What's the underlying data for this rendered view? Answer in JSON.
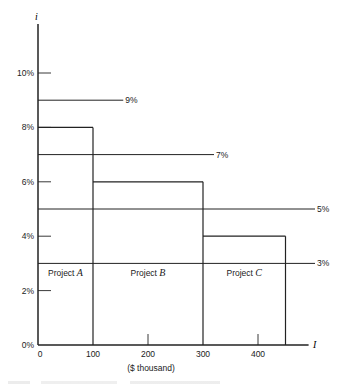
{
  "chart_data": {
    "type": "bar",
    "title": "",
    "xlabel": "($ thousand)",
    "x_axis_symbol": "I",
    "y_axis_symbol": "i",
    "xlim": [
      0,
      500
    ],
    "ylim": [
      0,
      12
    ],
    "grid": false,
    "x_ticks": [
      {
        "value": 0,
        "label": "0"
      },
      {
        "value": 100,
        "label": "100"
      },
      {
        "value": 200,
        "label": "200"
      },
      {
        "value": 300,
        "label": "300"
      },
      {
        "value": 400,
        "label": "400"
      }
    ],
    "y_ticks": [
      {
        "value": 0,
        "label": "0%"
      },
      {
        "value": 2,
        "label": "2%"
      },
      {
        "value": 4,
        "label": "4%"
      },
      {
        "value": 6,
        "label": "6%"
      },
      {
        "value": 8,
        "label": "8%"
      },
      {
        "value": 10,
        "label": "10%"
      }
    ],
    "projects": [
      {
        "name": "Project",
        "letter": "A",
        "x_start": 0,
        "x_end": 100,
        "rate": 8
      },
      {
        "name": "Project",
        "letter": "B",
        "x_start": 100,
        "x_end": 300,
        "rate": 6
      },
      {
        "name": "Project",
        "letter": "C",
        "x_start": 300,
        "x_end": 450,
        "rate": 4
      }
    ],
    "rate_lines": [
      {
        "rate": 9,
        "x_end": 155,
        "label": "9%"
      },
      {
        "rate": 7,
        "x_end": 320,
        "label": "7%"
      },
      {
        "rate": 5,
        "x_end": 510,
        "label": "5%"
      },
      {
        "rate": 3,
        "x_end": 510,
        "label": "3%"
      }
    ]
  }
}
